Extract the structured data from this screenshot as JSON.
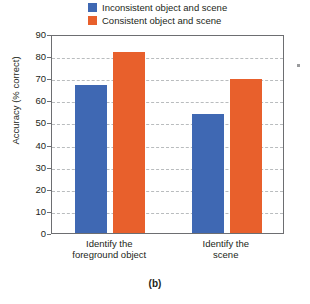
{
  "figure": {
    "caption": "(b)"
  },
  "legend": {
    "position": "top-center",
    "entries": [
      {
        "label": "Inconsistent object and scene",
        "color": "#3F68B3",
        "swatch_name": "legend-swatch-inconsistent"
      },
      {
        "label": "Consistent object and scene",
        "color": "#E8602C",
        "swatch_name": "legend-swatch-consistent"
      }
    ]
  },
  "axes": {
    "y_title": "Accuracy (% correct)",
    "y_ticks": [
      "0",
      "10",
      "20",
      "30",
      "40",
      "50",
      "60",
      "70",
      "80",
      "90"
    ],
    "x_group_labels": [
      "Identify the\nforeground object",
      "Identify the\nscene"
    ]
  },
  "chart_data": {
    "type": "bar",
    "title": "",
    "subtitle": "",
    "xlabel": "",
    "ylabel": "Accuracy (% correct)",
    "ylim": [
      0,
      90
    ],
    "ytick_step": 10,
    "grid": true,
    "grid_style": "dashed-horizontal",
    "legend_position": "top-center",
    "categories": [
      "Identify the foreground object",
      "Identify the scene"
    ],
    "series": [
      {
        "name": "Inconsistent object and scene",
        "color": "#3F68B3",
        "values": [
          67,
          54
        ]
      },
      {
        "name": "Consistent object and scene",
        "color": "#E8602C",
        "values": [
          82,
          69.5
        ]
      }
    ],
    "annotations": [
      "(b)"
    ]
  }
}
